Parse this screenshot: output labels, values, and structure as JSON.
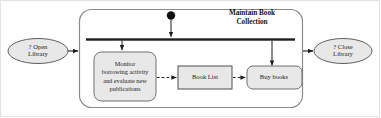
{
  "diagram": {
    "type": "uml-activity-diagram",
    "title": "Maintain Book Collection",
    "colors": {
      "node_fill": "#e8e8e8",
      "node_stroke": "#6f6f6f",
      "container_stroke": "#8a8a8a",
      "flow_stroke": "#1d1d1d",
      "fork_bar": "#1d1d1d",
      "initial_node": "#111111",
      "frame_border": "#e2e2e2",
      "background": "#ffffff"
    },
    "container": {
      "name": "maintain-book-collection",
      "label": "Maintain Book\nCollection",
      "shape": "rounded-rectangle"
    },
    "nodes": [
      {
        "id": "open-library",
        "label": "? Open\nLibrary",
        "shape": "ellipse",
        "kind": "entry-point"
      },
      {
        "id": "close-library",
        "label": "? Close\nLibrary",
        "shape": "ellipse",
        "kind": "exit-point"
      },
      {
        "id": "monitor-activity",
        "label": "Monitor\nborrowing activity\nand evaluate new\npublications",
        "shape": "rounded-rectangle",
        "kind": "action"
      },
      {
        "id": "book-list",
        "label": "Book List",
        "shape": "rectangle",
        "kind": "object-node"
      },
      {
        "id": "buy-books",
        "label": "Buy books",
        "shape": "rounded-rectangle",
        "kind": "action"
      },
      {
        "id": "initial-node",
        "label": "",
        "shape": "filled-circle",
        "kind": "initial-node"
      },
      {
        "id": "fork-bar",
        "label": "",
        "shape": "horizontal-bar",
        "kind": "fork"
      }
    ],
    "edges": [
      {
        "id": "open-to-container",
        "from": "open-library",
        "to": "maintain-book-collection",
        "style": "solid"
      },
      {
        "id": "initial-to-fork",
        "from": "initial-node",
        "to": "fork-bar",
        "style": "solid"
      },
      {
        "id": "fork-to-monitor",
        "from": "fork-bar",
        "to": "monitor-activity",
        "style": "solid"
      },
      {
        "id": "fork-to-buy",
        "from": "fork-bar",
        "to": "buy-books",
        "style": "solid"
      },
      {
        "id": "monitor-to-booklist",
        "from": "monitor-activity",
        "to": "book-list",
        "style": "dashed"
      },
      {
        "id": "booklist-to-buy",
        "from": "book-list",
        "to": "buy-books",
        "style": "dashed"
      },
      {
        "id": "container-to-close",
        "from": "maintain-book-collection",
        "to": "close-library",
        "style": "solid"
      }
    ]
  }
}
